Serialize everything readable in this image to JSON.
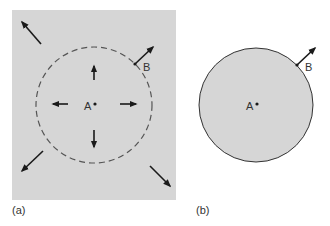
{
  "panels": [
    {
      "id": "a",
      "caption": "(a)",
      "point_A": "A",
      "point_B": "B",
      "boundary": "dashed circle",
      "background": "gray rectangle"
    },
    {
      "id": "b",
      "caption": "(b)",
      "point_A": "A",
      "point_B": "B",
      "boundary": "solid filled circle"
    }
  ],
  "colors": {
    "fill_gray": "#d6d6d6",
    "stroke": "#1a1a1a",
    "dashed": "#555555",
    "text": "#333333"
  }
}
